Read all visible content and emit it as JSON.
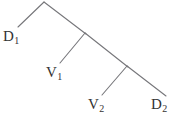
{
  "diagram": {
    "type": "tree",
    "stroke_color": "#76767a",
    "background_color": "#ffffff",
    "stroke_width": 1.1,
    "nodes": [
      {
        "id": "root",
        "name": "root-node",
        "x": 44,
        "y": 2,
        "label": ""
      },
      {
        "id": "n1",
        "name": "internal-node-1",
        "x": 85,
        "y": 33,
        "label": ""
      },
      {
        "id": "n2",
        "name": "internal-node-2",
        "x": 127,
        "y": 66,
        "label": ""
      },
      {
        "id": "d1",
        "name": "leaf-d1",
        "x": 18,
        "y": 27,
        "label": "D",
        "sub": "1"
      },
      {
        "id": "v1",
        "name": "leaf-v1",
        "x": 60,
        "y": 63,
        "label": "V",
        "sub": "1"
      },
      {
        "id": "v2",
        "name": "leaf-v2",
        "x": 102,
        "y": 95,
        "label": "V",
        "sub": "2"
      },
      {
        "id": "d2",
        "name": "leaf-d2",
        "x": 165,
        "y": 96,
        "label": "D",
        "sub": "2"
      }
    ],
    "edges": [
      {
        "name": "edge-root-d1",
        "from": "root",
        "to": "d1",
        "x1": 44,
        "y1": 2,
        "x2": 18,
        "y2": 27
      },
      {
        "name": "edge-root-n1",
        "from": "root",
        "to": "n1",
        "x1": 44,
        "y1": 2,
        "x2": 86,
        "y2": 34
      },
      {
        "name": "edge-n1-v1",
        "from": "n1",
        "to": "v1",
        "x1": 85,
        "y1": 33,
        "x2": 60,
        "y2": 63
      },
      {
        "name": "edge-n1-n2",
        "from": "n1",
        "to": "n2",
        "x1": 85,
        "y1": 33,
        "x2": 128,
        "y2": 67
      },
      {
        "name": "edge-n2-v2",
        "from": "n2",
        "to": "v2",
        "x1": 127,
        "y1": 66,
        "x2": 102,
        "y2": 95
      },
      {
        "name": "edge-n2-d2",
        "from": "n2",
        "to": "d2",
        "x1": 127,
        "y1": 66,
        "x2": 166,
        "y2": 96
      }
    ],
    "labels": {
      "d1": {
        "text": "D",
        "subscript": "1",
        "full": "D1"
      },
      "v1": {
        "text": "V",
        "subscript": "1",
        "full": "V1"
      },
      "v2": {
        "text": "V",
        "subscript": "2",
        "full": "V2"
      },
      "d2": {
        "text": "D",
        "subscript": "2",
        "full": "D2"
      }
    }
  }
}
